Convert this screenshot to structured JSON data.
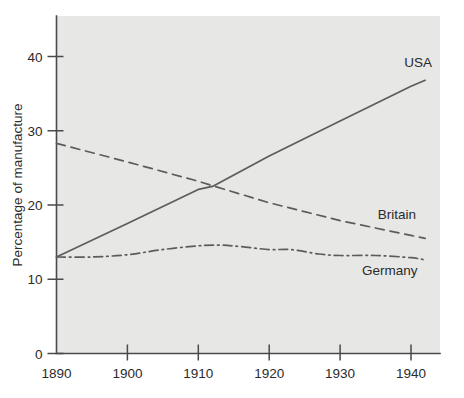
{
  "chart_data": {
    "type": "line",
    "title": "",
    "subtitle": "",
    "xlabel": "",
    "ylabel": "Percentage of manufacture",
    "xlim": [
      1890,
      1943
    ],
    "ylim": [
      0,
      44
    ],
    "grid": false,
    "legend_position": "inline-right-of-line-ends",
    "x_ticks": [
      1890,
      1900,
      1910,
      1920,
      1930,
      1940
    ],
    "x_tick_labels": [
      "1890",
      "1900",
      "1910",
      "1920",
      "1930",
      "1940"
    ],
    "y_ticks": [
      0,
      10,
      20,
      30,
      40
    ],
    "y_tick_labels": [
      "0",
      "10",
      "20",
      "30",
      "40"
    ],
    "series": [
      {
        "name": "USA",
        "label": "USA",
        "style": "solid",
        "color": "#5c5c5c",
        "x": [
          1890,
          1900,
          1910,
          1912,
          1920,
          1930,
          1940,
          1942
        ],
        "values": [
          13.0,
          17.5,
          22.1,
          22.5,
          26.6,
          31.3,
          36.0,
          36.8
        ]
      },
      {
        "name": "Britain",
        "label": "Britain",
        "style": "dashed",
        "color": "#5c5c5c",
        "x": [
          1890,
          1900,
          1910,
          1912,
          1920,
          1930,
          1940,
          1942
        ],
        "values": [
          28.3,
          25.8,
          23.2,
          22.6,
          20.3,
          17.9,
          15.9,
          15.5
        ]
      },
      {
        "name": "Germany",
        "label": "Germany",
        "style": "dash-dot",
        "color": "#5c5c5c",
        "x": [
          1890,
          1895,
          1900,
          1905,
          1910,
          1913,
          1916,
          1920,
          1923,
          1927,
          1930,
          1935,
          1940,
          1942
        ],
        "values": [
          13.0,
          13.0,
          13.3,
          14.0,
          14.5,
          14.6,
          14.4,
          14.0,
          14.0,
          13.4,
          13.2,
          13.2,
          12.9,
          12.6
        ]
      }
    ],
    "annotations": [
      {
        "text": "USA",
        "x": 1941,
        "y": 38.6
      },
      {
        "text": "Britain",
        "x": 1938,
        "y": 18.1
      },
      {
        "text": "Germany",
        "x": 1937,
        "y": 10.6
      }
    ]
  }
}
